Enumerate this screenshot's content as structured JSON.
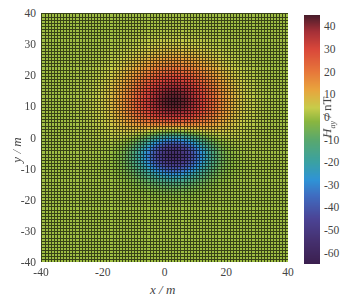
{
  "chart_data": {
    "type": "heatmap",
    "title": "",
    "xlabel": "x / m",
    "ylabel": "y / m",
    "colorbar_label": "H_ay / nT",
    "colorbar_label_main": "H",
    "colorbar_label_sub": "ay",
    "colorbar_label_unit": " / nT",
    "xlim": [
      -40,
      40
    ],
    "ylim": [
      -40,
      40
    ],
    "clim": [
      -65,
      45
    ],
    "grid": true,
    "grid_spacing_m": 1,
    "xticks": [
      "-40",
      "-20",
      "0",
      "20",
      "40"
    ],
    "yticks": [
      "40",
      "30",
      "20",
      "10",
      "0",
      "-10",
      "-20",
      "-30",
      "-40"
    ],
    "colorbar_ticks": [
      "40",
      "30",
      "20",
      "10",
      "0",
      "-10",
      "-20",
      "-30",
      "-40",
      "-50",
      "-60"
    ],
    "features": [
      {
        "name": "positive-anomaly",
        "x": 3,
        "y": 11,
        "peak_value": 45,
        "sigma_x": 11,
        "sigma_y": 9
      },
      {
        "name": "negative-anomaly",
        "x": 3,
        "y": -5,
        "peak_value": -65,
        "sigma_x": 8,
        "sigma_y": 5.5
      }
    ],
    "background_value": 0,
    "colormap": [
      {
        "v": -65,
        "color": "#3b1f4f"
      },
      {
        "v": -55,
        "color": "#45306f"
      },
      {
        "v": -45,
        "color": "#4b4496"
      },
      {
        "v": -35,
        "color": "#3f6cc0"
      },
      {
        "v": -28,
        "color": "#2f93d6"
      },
      {
        "v": -20,
        "color": "#3aa1a2"
      },
      {
        "v": -10,
        "color": "#5aa86c"
      },
      {
        "v": -2,
        "color": "#8ab63f"
      },
      {
        "v": 4,
        "color": "#c7cc4a"
      },
      {
        "v": 12,
        "color": "#e8a43d"
      },
      {
        "v": 20,
        "color": "#e7773a"
      },
      {
        "v": 30,
        "color": "#d9473a"
      },
      {
        "v": 38,
        "color": "#a32f37"
      },
      {
        "v": 45,
        "color": "#4a1d2b"
      }
    ]
  }
}
